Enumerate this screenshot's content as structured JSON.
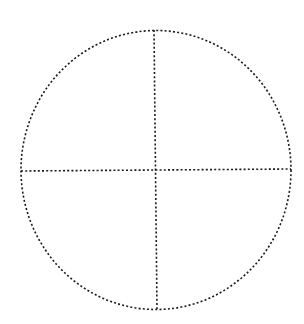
{
  "diagram": {
    "type": "circle-divided-into-quadrants",
    "background": "#ffffff",
    "stroke_color": "#1a1a1a",
    "stroke_style": "dotted",
    "circle": {
      "cx": 156,
      "cy": 170,
      "rx": 135,
      "ry": 139.5
    },
    "vertical_line": {
      "x1": 154,
      "y1": 30,
      "x2": 157,
      "y2": 309
    },
    "horizontal_line": {
      "x1": 21,
      "y1": 171,
      "x2": 291,
      "y2": 169
    },
    "quadrants": 4
  }
}
